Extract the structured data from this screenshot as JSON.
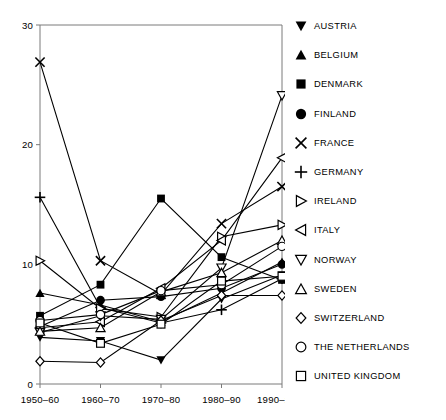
{
  "chart_data": {
    "type": "line",
    "title": "",
    "subtitle": "",
    "xlabel": "",
    "ylabel": "",
    "categories": [
      "1950–60",
      "1960–70",
      "1970–80",
      "1980–90",
      "1990–2000"
    ],
    "xtick_labels": [
      "1950–60",
      "1960–70",
      "1970–80",
      "1980–90",
      "1990–2000"
    ],
    "ytick_labels": [
      "0",
      "10",
      "20",
      "30"
    ],
    "yticks": [
      0,
      10,
      20,
      30
    ],
    "ylim": [
      0,
      30
    ],
    "grid": false,
    "legend_position": "right",
    "series": [
      {
        "name": "AUSTRIA",
        "marker": "triangle-down-filled",
        "values": [
          3.9,
          3.6,
          2.0,
          7.1,
          9.1
        ]
      },
      {
        "name": "BELGIUM",
        "marker": "triangle-up-filled",
        "values": [
          7.6,
          6.6,
          5.2,
          7.6,
          10.2
        ]
      },
      {
        "name": "DENMARK",
        "marker": "square-filled",
        "values": [
          5.7,
          8.3,
          15.5,
          10.6,
          8.7
        ]
      },
      {
        "name": "FINLAND",
        "marker": "circle-filled",
        "values": [
          4.8,
          7.0,
          7.3,
          8.0,
          10.0
        ]
      },
      {
        "name": "FRANCE",
        "marker": "cross-x",
        "values": [
          26.9,
          10.3,
          7.5,
          13.4,
          16.5
        ]
      },
      {
        "name": "GERMANY",
        "marker": "plus",
        "values": [
          15.6,
          6.4,
          5.1,
          6.2,
          8.8
        ]
      },
      {
        "name": "IRELAND",
        "marker": "triangle-right-open",
        "values": [
          10.3,
          6.3,
          5.6,
          12.3,
          13.3
        ]
      },
      {
        "name": "ITALY",
        "marker": "triangle-left-open",
        "values": [
          4.7,
          5.2,
          8.0,
          12.0,
          18.9
        ]
      },
      {
        "name": "NORWAY",
        "marker": "triangle-down-open",
        "values": [
          4.3,
          5.7,
          5.4,
          9.7,
          24.1
        ]
      },
      {
        "name": "SWEDEN",
        "marker": "triangle-up-open",
        "values": [
          4.4,
          4.7,
          7.7,
          9.3,
          12.0
        ]
      },
      {
        "name": "SWITZERLAND",
        "marker": "diamond-open",
        "values": [
          1.9,
          1.8,
          5.3,
          7.4,
          7.4
        ]
      },
      {
        "name": "THE NETHERLANDS",
        "marker": "circle-open",
        "values": [
          5.3,
          5.8,
          7.8,
          8.3,
          11.5
        ]
      },
      {
        "name": "UNITED KINGDOM",
        "marker": "square-open",
        "values": [
          5.1,
          3.4,
          5.0,
          8.6,
          9.0
        ]
      }
    ]
  },
  "legend": {
    "items": [
      {
        "label": "AUSTRIA",
        "marker": "triangle-down-filled"
      },
      {
        "label": "BELGIUM",
        "marker": "triangle-up-filled"
      },
      {
        "label": "DENMARK",
        "marker": "square-filled"
      },
      {
        "label": "FINLAND",
        "marker": "circle-filled"
      },
      {
        "label": "FRANCE",
        "marker": "cross-x"
      },
      {
        "label": "GERMANY",
        "marker": "plus"
      },
      {
        "label": "IRELAND",
        "marker": "triangle-right-open"
      },
      {
        "label": "ITALY",
        "marker": "triangle-left-open"
      },
      {
        "label": "NORWAY",
        "marker": "triangle-down-open"
      },
      {
        "label": "SWEDEN",
        "marker": "triangle-up-open"
      },
      {
        "label": "SWITZERLAND",
        "marker": "diamond-open"
      },
      {
        "label": "THE NETHERLANDS",
        "marker": "circle-open"
      },
      {
        "label": "UNITED KINGDOM",
        "marker": "square-open"
      }
    ]
  },
  "colors": {
    "line": "#000000",
    "axis": "#7a7a7a",
    "text": "#000000",
    "background": "#ffffff"
  }
}
